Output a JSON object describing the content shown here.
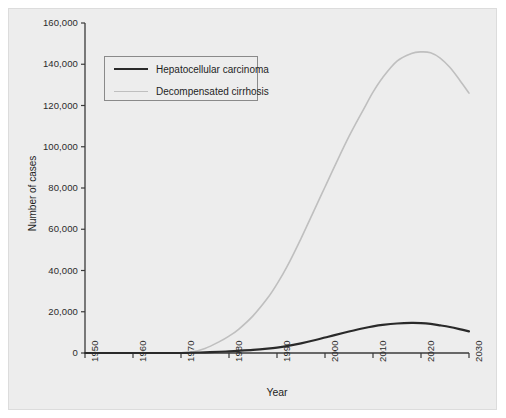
{
  "chart_data": {
    "type": "line",
    "title": "",
    "xlabel": "Year",
    "ylabel": "Number of cases",
    "xlim": [
      1950,
      2030
    ],
    "ylim": [
      0,
      160000
    ],
    "grid": false,
    "legend_position": "upper-left-inset",
    "x_ticks": [
      1950,
      1960,
      1970,
      1980,
      1990,
      2000,
      2010,
      2020,
      2030
    ],
    "x_tick_labels": [
      "1950",
      "1960",
      "1970",
      "1980",
      "1990",
      "2000",
      "2010",
      "2020",
      "2030"
    ],
    "y_ticks": [
      0,
      20000,
      40000,
      60000,
      80000,
      100000,
      120000,
      140000,
      160000
    ],
    "y_tick_labels": [
      "0",
      "20,000",
      "40,000",
      "60,000",
      "80,000",
      "100,000",
      "120,000",
      "140,000",
      "160,000"
    ],
    "x": [
      1950,
      1955,
      1960,
      1965,
      1970,
      1972,
      1975,
      1978,
      1980,
      1982,
      1985,
      1988,
      1990,
      1992,
      1995,
      1998,
      2000,
      2002,
      2005,
      2008,
      2010,
      2012,
      2015,
      2018,
      2020,
      2022,
      2024,
      2026,
      2028,
      2030
    ],
    "series": [
      {
        "name": "Hepatocellular carcinoma",
        "color": "#2a2a2a",
        "width": 2.2,
        "values": [
          0,
          0,
          0,
          0,
          0,
          120,
          330,
          600,
          800,
          1050,
          1500,
          2100,
          2600,
          3300,
          4700,
          6300,
          7500,
          8700,
          10400,
          12000,
          12900,
          13600,
          14300,
          14600,
          14500,
          14100,
          13400,
          12600,
          11600,
          10500
        ]
      },
      {
        "name": "Decompensated cirrhosis",
        "color": "#bfbfbf",
        "width": 1.6,
        "values": [
          0,
          0,
          0,
          0,
          0,
          300,
          2200,
          5500,
          8200,
          11500,
          18000,
          26500,
          33500,
          41500,
          55500,
          70500,
          80500,
          90500,
          105000,
          118000,
          126500,
          133500,
          141500,
          145200,
          146000,
          145600,
          143000,
          138500,
          132500,
          126000
        ]
      }
    ]
  },
  "legend": {
    "entries": [
      {
        "label": "Hepatocellular carcinoma",
        "color": "#2a2a2a",
        "thickness": "2.2"
      },
      {
        "label": "Decompensated cirrhosis",
        "color": "#bfbfbf",
        "thickness": "1.6"
      }
    ]
  },
  "colors": {
    "background": "#ededed",
    "page": "#ffffff",
    "axis": "#3a3a3a",
    "frame_border": "#dcdcdc",
    "legend_border": "#8a8a8a",
    "text": "#1e1e1e"
  }
}
